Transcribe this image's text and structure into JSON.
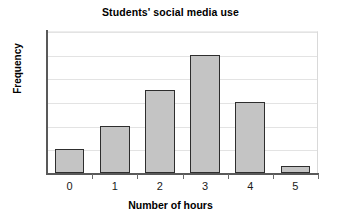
{
  "chart_data": {
    "type": "bar",
    "title": "Students' social media use",
    "xlabel": "Number of hours",
    "ylabel": "Frequency",
    "categories": [
      "0",
      "1",
      "2",
      "3",
      "4",
      "5"
    ],
    "values": [
      1,
      2,
      3.5,
      5,
      3,
      0.3
    ],
    "ylim": [
      0,
      6
    ],
    "yticks": [
      0,
      1,
      2,
      3,
      4,
      5,
      6
    ],
    "ytick_labels": [],
    "grid": true,
    "legend": false,
    "legend_position": "none",
    "bar_fill_color": "#c4c4c4",
    "bar_edge_color": "#2e2e2e",
    "gridline_color": "#e3e3e3",
    "axis_color": "#595959",
    "background_color": "#ffffff"
  }
}
